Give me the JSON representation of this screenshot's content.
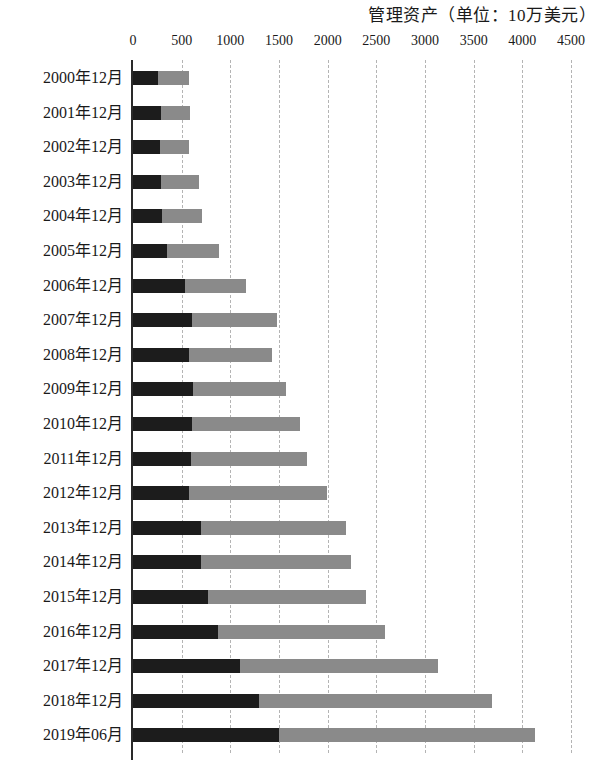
{
  "chart": {
    "title": "管理资产（单位：10万美元）",
    "xlabel": "",
    "ylabel": ""
  },
  "chart_data": {
    "type": "bar",
    "orientation": "horizontal",
    "stacked": true,
    "title": "管理资产（单位：10万美元）",
    "xlabel": "",
    "ylabel": "",
    "xlim": [
      0,
      4500
    ],
    "xticks": [
      0,
      500,
      1000,
      1500,
      2000,
      2500,
      3000,
      3500,
      4000,
      4500
    ],
    "xtick_labels": [
      "0",
      "500",
      "1000",
      "1500",
      "2000",
      "2500",
      "3000",
      "3500",
      "4000",
      "4500"
    ],
    "grid": true,
    "grid_axis": "x",
    "grid_style": "dashed",
    "legend": false,
    "legend_position": "none",
    "categories": [
      "2000年12月",
      "2001年12月",
      "2002年12月",
      "2003年12月",
      "2004年12月",
      "2005年12月",
      "2006年12月",
      "2007年12月",
      "2008年12月",
      "2009年12月",
      "2010年12月",
      "2011年12月",
      "2012年12月",
      "2013年12月",
      "2014年12月",
      "2015年12月",
      "2016年12月",
      "2017年12月",
      "2018年12月",
      "2019年06月"
    ],
    "series": [
      {
        "name": "series-1",
        "color": "#1c1c1c",
        "values": [
          260,
          290,
          280,
          290,
          300,
          350,
          530,
          610,
          580,
          620,
          610,
          600,
          580,
          700,
          700,
          770,
          870,
          1100,
          1290,
          1500
        ]
      },
      {
        "name": "series-2",
        "color": "#8a8a8a",
        "values": [
          320,
          300,
          300,
          390,
          410,
          530,
          630,
          870,
          850,
          950,
          1110,
          1190,
          1410,
          1490,
          1540,
          1620,
          1720,
          2030,
          2400,
          2630
        ]
      }
    ],
    "totals": [
      580,
      590,
      580,
      680,
      710,
      880,
      1160,
      1480,
      1430,
      1570,
      1720,
      1790,
      1990,
      2190,
      2240,
      2390,
      2590,
      3130,
      3690,
      4130
    ],
    "colors": {
      "segment_dark": "#1c1c1c",
      "segment_light": "#8a8a8a",
      "gridline": "#b4b4b4",
      "axis": "#2a2a2a",
      "background": "#ffffff"
    }
  }
}
